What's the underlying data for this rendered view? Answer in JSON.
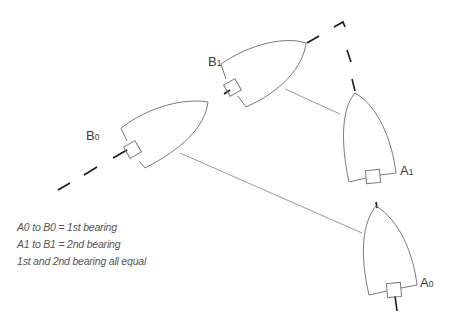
{
  "diagram": {
    "title": "",
    "colors": {
      "hull_outline": "#7a7a7a",
      "sight_line": "#9a9a9a",
      "track_dashed": "#1a1a1a",
      "text": "#3a3a3a",
      "caption_text": "#555555",
      "background": "#ffffff"
    },
    "boats": [
      {
        "id": "B0",
        "letter": "B",
        "index": "0",
        "role": "other vessel, first position"
      },
      {
        "id": "B1",
        "letter": "B",
        "index": "1",
        "role": "other vessel, second position"
      },
      {
        "id": "A1",
        "letter": "A",
        "index": "1",
        "role": "own vessel, second position"
      },
      {
        "id": "A0",
        "letter": "A",
        "index": "0",
        "role": "own vessel, first position"
      }
    ],
    "sight_lines": [
      {
        "from": "A0",
        "to": "B0",
        "name": "1st bearing"
      },
      {
        "from": "A1",
        "to": "B1",
        "name": "2nd bearing"
      }
    ],
    "track": {
      "style": "dashed",
      "description": "collision course track of B meeting A"
    },
    "legend": [
      "A0 to B0 = 1st bearing",
      "A1 to B1 = 2nd bearing",
      "1st and 2nd bearing all equal"
    ]
  }
}
